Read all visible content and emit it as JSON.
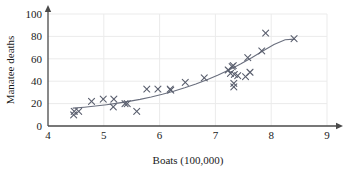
{
  "chart_data": {
    "type": "scatter",
    "title": "",
    "xlabel": "Boats (100,000)",
    "ylabel": "Manatee deaths",
    "xlim": [
      4,
      9
    ],
    "ylim": [
      0,
      100
    ],
    "xticks": [
      4,
      5,
      6,
      7,
      8,
      9
    ],
    "yticks": [
      0,
      20,
      40,
      60,
      80,
      100
    ],
    "grid": true,
    "legend": null,
    "marker": "x",
    "marker_color": "#5a5f6e",
    "curve_color": "#6a6f7e",
    "points": [
      {
        "x": 4.47,
        "y": 13
      },
      {
        "x": 4.46,
        "y": 10
      },
      {
        "x": 4.55,
        "y": 13
      },
      {
        "x": 4.78,
        "y": 22
      },
      {
        "x": 4.99,
        "y": 24
      },
      {
        "x": 5.17,
        "y": 17
      },
      {
        "x": 5.18,
        "y": 24
      },
      {
        "x": 5.38,
        "y": 20
      },
      {
        "x": 5.42,
        "y": 20
      },
      {
        "x": 5.59,
        "y": 13
      },
      {
        "x": 5.77,
        "y": 33
      },
      {
        "x": 5.97,
        "y": 33
      },
      {
        "x": 6.19,
        "y": 33
      },
      {
        "x": 6.2,
        "y": 32
      },
      {
        "x": 6.46,
        "y": 39
      },
      {
        "x": 6.8,
        "y": 43
      },
      {
        "x": 7.23,
        "y": 50
      },
      {
        "x": 7.27,
        "y": 47
      },
      {
        "x": 7.3,
        "y": 53
      },
      {
        "x": 7.32,
        "y": 54
      },
      {
        "x": 7.33,
        "y": 38
      },
      {
        "x": 7.33,
        "y": 35
      },
      {
        "x": 7.34,
        "y": 46
      },
      {
        "x": 7.4,
        "y": 45
      },
      {
        "x": 7.54,
        "y": 44
      },
      {
        "x": 7.58,
        "y": 61
      },
      {
        "x": 7.62,
        "y": 48
      },
      {
        "x": 7.83,
        "y": 67
      },
      {
        "x": 7.9,
        "y": 83
      },
      {
        "x": 8.41,
        "y": 78
      }
    ],
    "curve": {
      "label": "exponential fit",
      "x": [
        4.45,
        4.65,
        4.85,
        5.05,
        5.25,
        5.45,
        5.65,
        5.85,
        6.05,
        6.25,
        6.45,
        6.65,
        6.85,
        7.05,
        7.25,
        7.45,
        7.65,
        7.85,
        8.05,
        8.25,
        8.42
      ],
      "y": [
        16.0,
        16.8,
        17.8,
        19.0,
        20.4,
        22.0,
        23.8,
        25.9,
        28.3,
        31.0,
        34.1,
        37.5,
        41.3,
        45.5,
        50.2,
        55.4,
        61.0,
        66.9,
        72.8,
        77.0,
        77.6
      ]
    }
  }
}
